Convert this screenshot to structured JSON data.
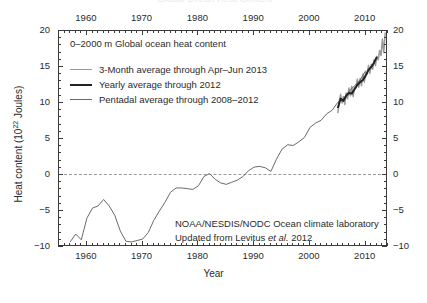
{
  "figure": {
    "cut_off_title": "Global Ocean Heat Content",
    "panel_title": "0–2000 m Global ocean heat content",
    "credit_line1": "NOAA/NESDIS/NODC Ocean climate laboratory",
    "credit_line2_pre": "Updated from Levitus ",
    "credit_line2_italic": "et al.",
    "credit_line2_post": " 2012"
  },
  "axes": {
    "xlabel": "Year",
    "ylabel_pre": "Heat content (10",
    "ylabel_sup": "22",
    "ylabel_post": " Joules)",
    "xticks": [
      "1960",
      "1970",
      "1980",
      "1990",
      "2000",
      "2010"
    ],
    "xtick_values": [
      1960,
      1970,
      1980,
      1990,
      2000,
      2010
    ],
    "yticks": [
      "20",
      "15",
      "10",
      "5",
      "0",
      "-5",
      "-10"
    ],
    "ytick_values": [
      20,
      15,
      10,
      5,
      0,
      -5,
      -10
    ],
    "xlim": [
      1955,
      2014
    ],
    "ylim": [
      -10,
      20
    ],
    "xminor_step": 1,
    "yminor_step": 1,
    "zero_reference_line": 0
  },
  "legend": {
    "position": "upper-left inside",
    "entries": [
      {
        "label": "3-Month average through Apr–Jun 2013",
        "color": "#9a9a9a",
        "width": 1.1
      },
      {
        "label": "Yearly average through 2012",
        "color": "#222222",
        "width": 2.1
      },
      {
        "label": "Pentadal average through 2008–2012",
        "color": "#6a6a6a",
        "width": 1.6
      }
    ]
  },
  "chart_data": {
    "type": "line",
    "title": "0–2000 m Global ocean heat content",
    "xlabel": "Year",
    "ylabel": "Heat content (10^22 Joules)",
    "xlim": [
      1955,
      2014
    ],
    "ylim": [
      -10,
      20
    ],
    "grid": false,
    "annotations": [
      "NOAA/NESDIS/NODC Ocean climate laboratory",
      "Updated from Levitus et al. 2012"
    ],
    "series": [
      {
        "name": "Pentadal average through 2008–2012",
        "color": "#6a6a6a",
        "x": [
          1957,
          1958,
          1959,
          1960,
          1961,
          1962,
          1963,
          1964,
          1965,
          1966,
          1967,
          1968,
          1969,
          1970,
          1971,
          1972,
          1973,
          1974,
          1975,
          1976,
          1977,
          1978,
          1979,
          1980,
          1981,
          1982,
          1983,
          1984,
          1985,
          1986,
          1987,
          1988,
          1989,
          1990,
          1991,
          1992,
          1993,
          1994,
          1995,
          1996,
          1997,
          1998,
          1999,
          2000,
          2001,
          2002,
          2003,
          2004,
          2005,
          2006,
          2007,
          2008,
          2009,
          2010
        ],
        "values": [
          -9.3,
          -8.2,
          -9.0,
          -6.0,
          -4.6,
          -4.3,
          -3.4,
          -4.3,
          -5.6,
          -7.8,
          -9.2,
          -9.3,
          -9.1,
          -8.9,
          -8.0,
          -6.3,
          -5.0,
          -3.8,
          -2.4,
          -1.8,
          -1.8,
          -1.9,
          -2.0,
          -1.5,
          -0.2,
          0.2,
          -0.6,
          -1.1,
          -1.3,
          -1.0,
          -0.7,
          -0.2,
          0.6,
          1.1,
          1.2,
          1.0,
          0.5,
          2.2,
          3.6,
          4.2,
          4.1,
          4.6,
          5.2,
          6.6,
          7.2,
          7.6,
          8.5,
          9.0,
          10.1,
          10.6,
          11.6,
          12.4,
          13.2,
          14.5
        ]
      },
      {
        "name": "Yearly average through 2012",
        "color": "#222222",
        "x": [
          2005,
          2005.5,
          2006,
          2006.5,
          2007,
          2007.5,
          2008,
          2008.5,
          2009,
          2009.5,
          2010,
          2010.5,
          2011,
          2011.5,
          2012
        ],
        "values": [
          9.3,
          10.6,
          10.3,
          11.0,
          11.4,
          11.3,
          11.9,
          12.5,
          12.9,
          13.2,
          13.8,
          14.6,
          15.0,
          15.6,
          16.4
        ]
      },
      {
        "name": "3-Month average through Apr–Jun 2013",
        "color": "#9a9a9a",
        "x": [
          2005,
          2005.25,
          2005.5,
          2005.75,
          2006,
          2006.25,
          2006.5,
          2006.75,
          2007,
          2007.25,
          2007.5,
          2007.75,
          2008,
          2008.25,
          2008.5,
          2008.75,
          2009,
          2009.25,
          2009.5,
          2009.75,
          2010,
          2010.25,
          2010.5,
          2010.75,
          2011,
          2011.25,
          2011.5,
          2011.75,
          2012,
          2012.25,
          2012.5,
          2012.75,
          2013,
          2013.25,
          2013.5
        ],
        "values": [
          8.6,
          10.2,
          11.2,
          10.0,
          10.9,
          9.8,
          11.4,
          10.6,
          12.1,
          11.0,
          12.3,
          10.9,
          12.2,
          12.1,
          13.3,
          12.2,
          13.4,
          12.4,
          14.0,
          12.9,
          14.2,
          14.0,
          15.2,
          14.1,
          15.4,
          14.7,
          16.0,
          15.2,
          16.5,
          16.0,
          17.3,
          16.6,
          18.9,
          17.0,
          19.8
        ]
      }
    ]
  }
}
